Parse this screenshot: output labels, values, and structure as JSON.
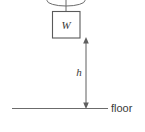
{
  "figure": {
    "type": "physics-free-body-diagram",
    "colors": {
      "line": "#6b6b6b",
      "box_stroke": "#5a5a5a",
      "dimension": "#5f5f5f",
      "text": "#3a3a3a",
      "background": "#ffffff"
    },
    "labels": {
      "weight": "W",
      "height": "h",
      "floor": "floor"
    },
    "geometry": {
      "pulley": {
        "cx": 66,
        "cy": 1,
        "rx": 19,
        "ry": 5
      },
      "string": {
        "x": 66,
        "y1": 1,
        "y2": 11
      },
      "box": {
        "x": 52,
        "y": 11,
        "width": 28,
        "height": 27
      },
      "dimension_arrow": {
        "x": 86,
        "y_top": 38,
        "y_bottom": 108
      },
      "floor_line": {
        "x1": 12,
        "x2": 106,
        "y": 108
      },
      "floor_label_pos": {
        "x": 111,
        "y": 108
      },
      "height_label_pos": {
        "x": 79,
        "y": 72
      }
    }
  }
}
